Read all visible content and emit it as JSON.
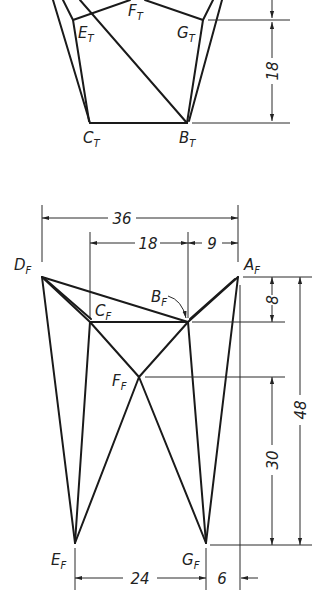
{
  "top_view": {
    "points": {
      "E": {
        "label": "E",
        "sub": "T"
      },
      "F": {
        "label": "F",
        "sub": "T"
      },
      "G": {
        "label": "G",
        "sub": "T"
      },
      "C": {
        "label": "C",
        "sub": "T"
      },
      "B": {
        "label": "B",
        "sub": "T"
      }
    },
    "dimensions": {
      "depth": "18"
    }
  },
  "front_view": {
    "points": {
      "D": {
        "label": "D",
        "sub": "F"
      },
      "A": {
        "label": "A",
        "sub": "F"
      },
      "C": {
        "label": "C",
        "sub": "F"
      },
      "B": {
        "label": "B",
        "sub": "F"
      },
      "F": {
        "label": "F",
        "sub": "F"
      },
      "E": {
        "label": "E",
        "sub": "F"
      },
      "G": {
        "label": "G",
        "sub": "F"
      }
    },
    "dimensions": {
      "overall_width": "36",
      "c_to_b": "18",
      "b_to_a": "9",
      "a_to_b_height": "8",
      "f_height": "30",
      "overall_height": "48",
      "e_to_g": "24",
      "g_offset": "6"
    }
  }
}
